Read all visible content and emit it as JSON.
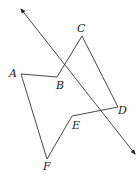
{
  "diagram": {
    "type": "geometry",
    "points": {
      "A": {
        "label": "A",
        "x": 21,
        "y": 74,
        "lx": 9,
        "ly": 77
      },
      "B": {
        "label": "B",
        "x": 57,
        "y": 77,
        "lx": 56,
        "ly": 89
      },
      "C": {
        "label": "C",
        "x": 82,
        "y": 36,
        "lx": 77,
        "ly": 32
      },
      "D": {
        "label": "D",
        "x": 118,
        "y": 107,
        "lx": 118,
        "ly": 114
      },
      "E": {
        "label": "E",
        "x": 72,
        "y": 116,
        "lx": 72,
        "ly": 129
      },
      "F": {
        "label": "F",
        "x": 47,
        "y": 159,
        "lx": 43,
        "ly": 170
      }
    },
    "polygon_order": [
      "A",
      "B",
      "C",
      "D",
      "E",
      "F"
    ],
    "line": {
      "x1": 21,
      "y1": 9,
      "x2": 135,
      "y2": 154,
      "arrows": "both"
    },
    "colors": {
      "stroke": "#333333",
      "label": "#222222",
      "background": "#ffffff"
    }
  }
}
